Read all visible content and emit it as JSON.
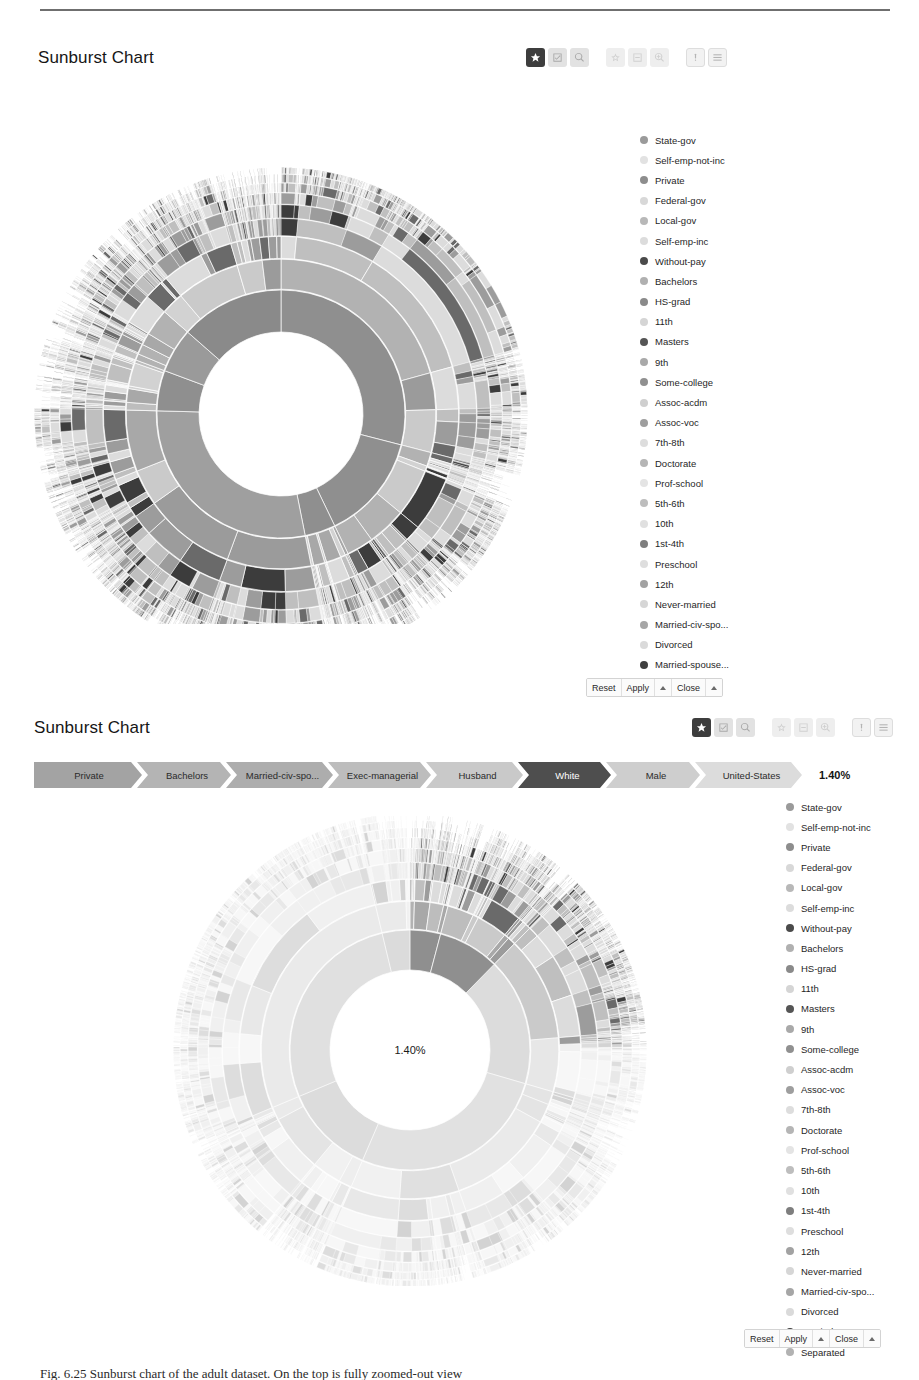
{
  "page": {
    "caption": "Fig. 6.25  Sunburst chart of the adult dataset. On the top is fully zoomed-out view"
  },
  "legend_items": [
    {
      "label": "State-gov",
      "color": "#9a9a9a"
    },
    {
      "label": "Self-emp-not-inc",
      "color": "#e2e2e2"
    },
    {
      "label": "Private",
      "color": "#8d8d8d"
    },
    {
      "label": "Federal-gov",
      "color": "#d8d8d8"
    },
    {
      "label": "Local-gov",
      "color": "#b8b8b8"
    },
    {
      "label": "Self-emp-inc",
      "color": "#dcdcdc"
    },
    {
      "label": "Without-pay",
      "color": "#4a4a4a"
    },
    {
      "label": "Bachelors",
      "color": "#b0b0b0"
    },
    {
      "label": "HS-grad",
      "color": "#8a8a8a"
    },
    {
      "label": "11th",
      "color": "#d5d5d5"
    },
    {
      "label": "Masters",
      "color": "#555555"
    },
    {
      "label": "9th",
      "color": "#a9a9a9"
    },
    {
      "label": "Some-college",
      "color": "#909090"
    },
    {
      "label": "Assoc-acdm",
      "color": "#cfcfcf"
    },
    {
      "label": "Assoc-voc",
      "color": "#9e9e9e"
    },
    {
      "label": "7th-8th",
      "color": "#dddddd"
    },
    {
      "label": "Doctorate",
      "color": "#b5b5b5"
    },
    {
      "label": "Prof-school",
      "color": "#e4e4e4"
    },
    {
      "label": "5th-6th",
      "color": "#bdbdbd"
    },
    {
      "label": "10th",
      "color": "#e0e0e0"
    },
    {
      "label": "1st-4th",
      "color": "#7e7e7e"
    },
    {
      "label": "Preschool",
      "color": "#dedede"
    },
    {
      "label": "12th",
      "color": "#a2a2a2"
    },
    {
      "label": "Never-married",
      "color": "#d6d6d6"
    },
    {
      "label": "Married-civ-spo...",
      "color": "#a6a6a6"
    },
    {
      "label": "Divorced",
      "color": "#dadada"
    },
    {
      "label": "Married-spouse...",
      "color": "#3f3f3f"
    },
    {
      "label": "Separated",
      "color": "#b2b2b2"
    }
  ],
  "toolbar": {
    "groups": [
      [
        {
          "name": "star-icon",
          "state": "active"
        },
        {
          "name": "checkbox-icon",
          "state": "normal"
        },
        {
          "name": "search-icon",
          "state": "normal"
        }
      ],
      [
        {
          "name": "star-outline-icon",
          "state": "ghost"
        },
        {
          "name": "collapse-icon",
          "state": "ghost"
        },
        {
          "name": "zoom-icon",
          "state": "ghost"
        }
      ],
      [
        {
          "name": "info-icon",
          "state": "plain"
        },
        {
          "name": "menu-icon",
          "state": "plain"
        }
      ]
    ]
  },
  "footer": {
    "reset_label": "Reset",
    "apply_label": "Apply",
    "close_label": "Close",
    "caret_icon": "caret-up-icon"
  },
  "panel1": {
    "title": "Sunburst Chart",
    "has_breadcrumb": false
  },
  "panel2": {
    "title": "Sunburst Chart",
    "center_value": "1.40%",
    "breadcrumb_percent": "1.40%",
    "breadcrumb": [
      {
        "label": "Private",
        "color": "#a3a3a3",
        "selected": false,
        "width": 108
      },
      {
        "label": "Bachelors",
        "color": "#b4b4b4",
        "selected": false,
        "width": 94
      },
      {
        "label": "Married-civ-spo...",
        "color": "#adadad",
        "selected": false,
        "width": 107
      },
      {
        "label": "Exec-managerial",
        "color": "#bdbdbd",
        "selected": false,
        "width": 103
      },
      {
        "label": "Husband",
        "color": "#c9c9c9",
        "selected": false,
        "width": 97
      },
      {
        "label": "White",
        "color": "#4e4e4e",
        "selected": true,
        "width": 93
      },
      {
        "label": "Male",
        "color": "#cecece",
        "selected": false,
        "width": 94
      },
      {
        "label": "United-States",
        "color": "#dcdcdc",
        "selected": false,
        "width": 107
      }
    ]
  },
  "chart_data": [
    {
      "type": "pie",
      "title": "Sunburst Chart",
      "subtitle": "fully zoomed-out view",
      "view": "full",
      "rings": 8,
      "inner_radius": 82,
      "outer_radius": 240,
      "legend_position": "right",
      "hierarchy_levels": [
        "workclass",
        "education",
        "marital-status",
        "occupation",
        "relationship",
        "race",
        "sex",
        "native-country"
      ],
      "categories": [
        "State-gov",
        "Self-emp-not-inc",
        "Private",
        "Federal-gov",
        "Local-gov",
        "Self-emp-inc",
        "Without-pay"
      ],
      "values": [
        4.2,
        7.8,
        69.7,
        3.0,
        6.4,
        3.4,
        0.04
      ],
      "annotations": []
    },
    {
      "type": "pie",
      "title": "Sunburst Chart",
      "subtitle": "drilled-down / highlighted path view",
      "view": "highlighted",
      "rings": 8,
      "inner_radius": 80,
      "outer_radius": 228,
      "legend_position": "right",
      "hierarchy_levels": [
        "workclass",
        "education",
        "marital-status",
        "occupation",
        "relationship",
        "race",
        "sex",
        "native-country"
      ],
      "highlight_path": [
        "Private",
        "Bachelors",
        "Married-civ-spo...",
        "Exec-managerial",
        "Husband",
        "White",
        "Male",
        "United-States"
      ],
      "highlight_value": 1.4,
      "highlight_label": "1.40%",
      "categories": [
        "State-gov",
        "Self-emp-not-inc",
        "Private",
        "Federal-gov",
        "Local-gov",
        "Self-emp-inc",
        "Without-pay"
      ],
      "values": [
        4.2,
        7.8,
        69.7,
        3.0,
        6.4,
        3.4,
        0.04
      ],
      "annotations": [
        "1.40%"
      ]
    }
  ]
}
